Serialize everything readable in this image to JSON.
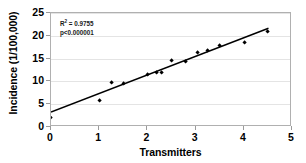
{
  "chart_data": {
    "type": "scatter",
    "title": "",
    "xlabel": "Transmitters",
    "ylabel": "Incidence (1/100,000)",
    "xlim": [
      0,
      5
    ],
    "ylim": [
      0,
      25
    ],
    "xticks": [
      0,
      1,
      2,
      3,
      4,
      5
    ],
    "yticks": [
      0,
      5,
      10,
      15,
      20,
      25
    ],
    "xtick_labels": [
      "0",
      "1",
      "2",
      "3",
      "4",
      "5"
    ],
    "ytick_labels": [
      "0",
      "5",
      "10",
      "15",
      "20",
      "25"
    ],
    "grid": "horizontal",
    "legend": "none",
    "marker_color": "#000000",
    "marker_shape": "diamond",
    "line_color": "#000000",
    "frame_color": "#b0b0b0",
    "gridline_color": "#e4e4e4",
    "points": [
      {
        "x": 0.0,
        "y": 2.1
      },
      {
        "x": 1.0,
        "y": 5.9
      },
      {
        "x": 1.25,
        "y": 9.8
      },
      {
        "x": 1.5,
        "y": 9.6
      },
      {
        "x": 2.0,
        "y": 11.5
      },
      {
        "x": 2.2,
        "y": 12.0
      },
      {
        "x": 2.3,
        "y": 12.0
      },
      {
        "x": 2.5,
        "y": 14.5
      },
      {
        "x": 2.8,
        "y": 14.4
      },
      {
        "x": 3.05,
        "y": 16.3
      },
      {
        "x": 3.25,
        "y": 16.8
      },
      {
        "x": 3.5,
        "y": 17.9
      },
      {
        "x": 4.02,
        "y": 18.5
      },
      {
        "x": 4.5,
        "y": 21.0
      }
    ],
    "fit_line": {
      "x_start": 0.0,
      "y_start": 2.9,
      "x_end": 4.55,
      "y_end": 21.6
    },
    "annotations": [
      {
        "text": "R² = 0.9755"
      },
      {
        "text": "p<0.000001"
      }
    ],
    "annotation_r2_prefix": "R",
    "annotation_r2_sup": "2",
    "annotation_r2_value": " = 0.9755",
    "annotation_p": "p<0.000001"
  }
}
